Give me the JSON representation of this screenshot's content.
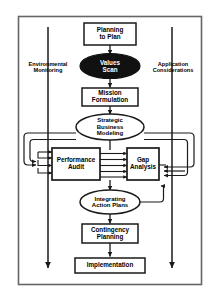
{
  "diagram": {
    "type": "flowchart",
    "frame": {
      "border_color": "#555555",
      "background": "#ffffff"
    },
    "nodes": [
      {
        "id": "planning_to_plan",
        "shape": "rectangle",
        "label": "Planning\nto Plan",
        "fill": "#ffffff",
        "text_color": "#000000"
      },
      {
        "id": "values_scan",
        "shape": "ellipse",
        "label": "Values\nScan",
        "fill": "#111111",
        "text_color": "#ffffff"
      },
      {
        "id": "mission_formulation",
        "shape": "rectangle",
        "label": "Mission\nFormulation",
        "fill": "#ffffff",
        "text_color": "#000000"
      },
      {
        "id": "strategic_business_modeling",
        "shape": "ellipse",
        "label": "Strategic\nBusiness\nModeling",
        "fill": "#ffffff",
        "text_color": "#000000"
      },
      {
        "id": "performance_audit",
        "shape": "rectangle",
        "label": "Performance\nAudit",
        "fill": "#ffffff",
        "text_color": "#000000"
      },
      {
        "id": "gap_analysis",
        "shape": "rectangle",
        "label": "Gap\nAnalysis",
        "fill": "#ffffff",
        "text_color": "#000000"
      },
      {
        "id": "integrating_action_plans",
        "shape": "ellipse",
        "label": "Integrating\nAction Plans",
        "fill": "#ffffff",
        "text_color": "#000000"
      },
      {
        "id": "contingency_planning",
        "shape": "rectangle",
        "label": "Contingency\nPlanning",
        "fill": "#ffffff",
        "text_color": "#000000"
      },
      {
        "id": "implementation",
        "shape": "rectangle",
        "label": "Implementation",
        "fill": "#ffffff",
        "text_color": "#000000"
      }
    ],
    "side_labels": [
      {
        "id": "environmental_monitoring",
        "label": "Environmental\nMonitoring",
        "side": "left"
      },
      {
        "id": "application_considerations",
        "label": "Application\nConsiderations",
        "side": "right"
      }
    ]
  }
}
